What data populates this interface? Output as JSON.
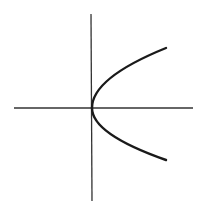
{
  "diagram": {
    "colors": {
      "background": "#ffffff",
      "axis": "#333333",
      "curve": "#1a1a1a"
    },
    "axes": {
      "x_axis": {
        "x1": 14,
        "y1": 108,
        "x2": 193,
        "y2": 108
      },
      "y_axis": {
        "x1": 91,
        "y1": 14,
        "x2": 92,
        "y2": 201
      }
    },
    "curve": {
      "vertex": [
        92,
        108
      ],
      "upper_end": [
        166,
        48
      ],
      "lower_end": [
        166,
        160
      ]
    },
    "labels": []
  }
}
